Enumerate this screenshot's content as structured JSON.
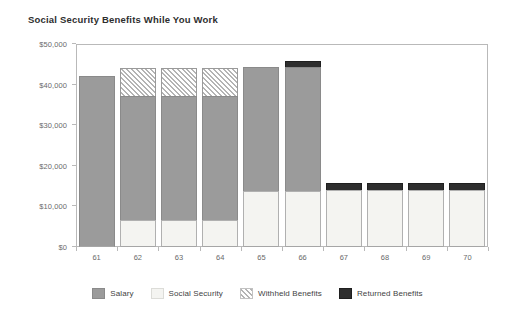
{
  "chart_data": {
    "type": "bar",
    "stacked": true,
    "title": "Social Security Benefits While You Work",
    "xlabel": "",
    "ylabel": "",
    "categories": [
      "61",
      "62",
      "63",
      "64",
      "65",
      "66",
      "67",
      "68",
      "69",
      "70"
    ],
    "ylim": [
      0,
      50000
    ],
    "yticks": [
      0,
      10000,
      20000,
      30000,
      40000,
      50000
    ],
    "ytick_labels": [
      "$0",
      "$10,000",
      "$20,000",
      "$30,000",
      "$40,000",
      "$50,000"
    ],
    "grid": false,
    "legend_position": "bottom",
    "series": [
      {
        "name": "Salary",
        "color": "#9b9b9b",
        "values": [
          42000,
          30500,
          30500,
          30500,
          30500,
          30500,
          0,
          0,
          0,
          0
        ]
      },
      {
        "name": "Social Security",
        "color": "#f4f4f1",
        "values": [
          0,
          6700,
          6700,
          6700,
          13800,
          13800,
          14000,
          14000,
          14000,
          14000
        ]
      },
      {
        "name": "Withheld Benefits",
        "color": "#b4b4b4",
        "pattern": "diagonal-hatch",
        "values": [
          0,
          7000,
          7000,
          7000,
          0,
          0,
          0,
          0,
          0,
          0
        ]
      },
      {
        "name": "Returned Benefits",
        "color": "#2e2e2e",
        "values": [
          0,
          0,
          0,
          0,
          0,
          1600,
          1800,
          1800,
          1800,
          1800
        ]
      }
    ],
    "bar_totals": [
      42000,
      44200,
      44200,
      44200,
      44300,
      45900,
      15800,
      15800,
      15800,
      15800
    ]
  },
  "legend": {
    "items": [
      {
        "label": "Salary",
        "swatch": "salary-swatch"
      },
      {
        "label": "Social Security",
        "swatch": "social-security-swatch"
      },
      {
        "label": "Withheld Benefits",
        "swatch": "withheld-benefits-swatch"
      },
      {
        "label": "Returned Benefits",
        "swatch": "returned-benefits-swatch"
      }
    ]
  }
}
